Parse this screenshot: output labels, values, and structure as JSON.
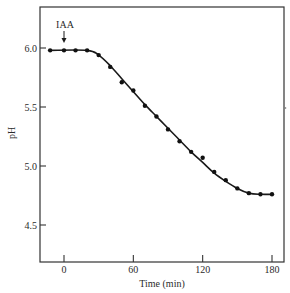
{
  "chart_data": {
    "type": "line",
    "title": "",
    "xlabel": "Time (min)",
    "ylabel": "pH",
    "xlim": [
      -20,
      190
    ],
    "ylim": [
      4.25,
      6.35
    ],
    "xticks": [
      0,
      60,
      120,
      180
    ],
    "xtick_labels": [
      "0",
      "60",
      "120",
      "180"
    ],
    "yticks": [
      4.5,
      5.0,
      5.5,
      6.0
    ],
    "ytick_labels": [
      "4.5",
      "5.0",
      "5.5",
      "6.0"
    ],
    "grid": false,
    "legend": null,
    "annotations": [
      {
        "text": "IAA",
        "x": 0,
        "arrow": "down",
        "points_to_y": 5.98
      }
    ],
    "series": [
      {
        "name": "pH",
        "marker": "circle",
        "line": "smooth",
        "x": [
          -12,
          0,
          10,
          20,
          30,
          40,
          50,
          60,
          70,
          80,
          90,
          100,
          110,
          120,
          130,
          140,
          150,
          160,
          170,
          180
        ],
        "y": [
          5.98,
          5.98,
          5.98,
          5.98,
          5.94,
          5.84,
          5.71,
          5.64,
          5.51,
          5.42,
          5.31,
          5.21,
          5.12,
          5.07,
          4.95,
          4.88,
          4.81,
          4.77,
          4.76,
          4.76
        ]
      }
    ],
    "fit_line": {
      "x": [
        -12,
        20,
        30,
        40,
        50,
        60,
        70,
        80,
        90,
        100,
        110,
        120,
        130,
        140,
        150,
        160,
        170,
        180
      ],
      "y": [
        5.98,
        5.98,
        5.94,
        5.85,
        5.74,
        5.63,
        5.52,
        5.42,
        5.32,
        5.22,
        5.12,
        5.03,
        4.94,
        4.87,
        4.81,
        4.77,
        4.76,
        4.76
      ]
    },
    "colors": {
      "ink": "#1a1a1a",
      "frame": "#333333",
      "background": "#ffffff"
    }
  }
}
